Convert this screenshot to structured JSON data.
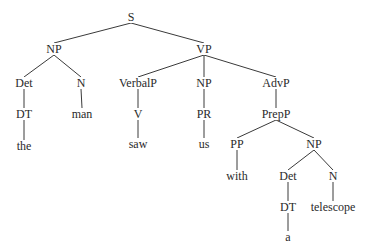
{
  "diagram": {
    "type": "syntax-tree",
    "sentence": "the man saw us with a telescope",
    "nodes": [
      {
        "id": "S",
        "label": "S",
        "x": 131,
        "y": 17
      },
      {
        "id": "NP1",
        "label": "NP",
        "x": 54,
        "y": 49
      },
      {
        "id": "VP",
        "label": "VP",
        "x": 204,
        "y": 49
      },
      {
        "id": "Det1",
        "label": "Det",
        "x": 24,
        "y": 83
      },
      {
        "id": "N1",
        "label": "N",
        "x": 81,
        "y": 83
      },
      {
        "id": "VerbalP",
        "label": "VerbalP",
        "x": 138,
        "y": 83
      },
      {
        "id": "NP2",
        "label": "NP",
        "x": 204,
        "y": 83
      },
      {
        "id": "AdvP",
        "label": "AdvP",
        "x": 276,
        "y": 83
      },
      {
        "id": "DT1",
        "label": "DT",
        "x": 24,
        "y": 114
      },
      {
        "id": "man",
        "label": "man",
        "x": 82,
        "y": 114
      },
      {
        "id": "V",
        "label": "V",
        "x": 138,
        "y": 114
      },
      {
        "id": "PR",
        "label": "PR",
        "x": 204,
        "y": 114
      },
      {
        "id": "PrepP",
        "label": "PrepP",
        "x": 276,
        "y": 114
      },
      {
        "id": "the",
        "label": "the",
        "x": 24,
        "y": 146
      },
      {
        "id": "saw",
        "label": "saw",
        "x": 138,
        "y": 144
      },
      {
        "id": "us",
        "label": "us",
        "x": 204,
        "y": 144
      },
      {
        "id": "PP",
        "label": "PP",
        "x": 237,
        "y": 144
      },
      {
        "id": "NP3",
        "label": "NP",
        "x": 314,
        "y": 144
      },
      {
        "id": "with",
        "label": "with",
        "x": 237,
        "y": 176
      },
      {
        "id": "Det2",
        "label": "Det",
        "x": 288,
        "y": 176
      },
      {
        "id": "N2",
        "label": "N",
        "x": 333,
        "y": 176
      },
      {
        "id": "DT2",
        "label": "DT",
        "x": 288,
        "y": 207
      },
      {
        "id": "telescope",
        "label": "telescope",
        "x": 333,
        "y": 207
      },
      {
        "id": "a",
        "label": "a",
        "x": 288,
        "y": 237
      }
    ],
    "edges": [
      [
        "S",
        "NP1"
      ],
      [
        "S",
        "VP"
      ],
      [
        "NP1",
        "Det1"
      ],
      [
        "NP1",
        "N1"
      ],
      [
        "VP",
        "VerbalP"
      ],
      [
        "VP",
        "NP2"
      ],
      [
        "VP",
        "AdvP"
      ],
      [
        "Det1",
        "DT1"
      ],
      [
        "N1",
        "man"
      ],
      [
        "VerbalP",
        "V"
      ],
      [
        "NP2",
        "PR"
      ],
      [
        "AdvP",
        "PrepP"
      ],
      [
        "DT1",
        "the"
      ],
      [
        "V",
        "saw"
      ],
      [
        "PR",
        "us"
      ],
      [
        "PrepP",
        "PP"
      ],
      [
        "PrepP",
        "NP3"
      ],
      [
        "PP",
        "with"
      ],
      [
        "NP3",
        "Det2"
      ],
      [
        "NP3",
        "N2"
      ],
      [
        "Det2",
        "DT2"
      ],
      [
        "N2",
        "telescope"
      ],
      [
        "DT2",
        "a"
      ]
    ],
    "edge_color": "#3a3a3a",
    "text_color": "#2a2a2a"
  }
}
